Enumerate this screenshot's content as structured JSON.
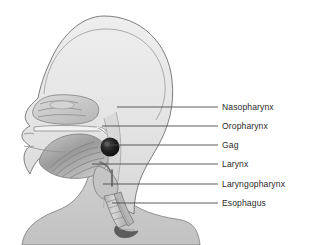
{
  "figure": {
    "background_color": "#ffffff",
    "outline_color": "#6f6f6f",
    "skin_fill_color": "#e6e6e6",
    "neck_fill_color": "#c9c9c9",
    "tissue_fill_color": "#bdbdbd",
    "dark_marker_color": "#1f1f1f",
    "leader_line_color": "#4a4a4a",
    "label_text_color": "#2b2b2b"
  },
  "labels": [
    {
      "id": "nasopharynx",
      "text": "Nasopharynx",
      "text_x": 222,
      "text_y": 102,
      "line_x1": 117,
      "line_x2": 218,
      "line_y": 107
    },
    {
      "id": "oropharynx",
      "text": "Oropharynx",
      "text_x": 222,
      "text_y": 121,
      "line_x1": 102,
      "line_x2": 218,
      "line_y": 126
    },
    {
      "id": "gag",
      "text": "Gag",
      "text_x": 222,
      "text_y": 140,
      "line_x1": 110,
      "line_x2": 218,
      "line_y": 145
    },
    {
      "id": "larynx",
      "text": "Larynx",
      "text_x": 222,
      "text_y": 159,
      "line_x1": 92,
      "line_x2": 218,
      "line_y": 164
    },
    {
      "id": "laryngopharynx",
      "text": "Laryngopharynx",
      "text_x": 222,
      "text_y": 179,
      "line_x1": 103,
      "line_x2": 218,
      "line_y": 184
    },
    {
      "id": "esophagus",
      "text": "Esophagus",
      "text_x": 222,
      "text_y": 198,
      "line_x1": 112,
      "line_x2": 218,
      "line_y": 203
    }
  ],
  "anatomy_parts": [
    {
      "id": "cranium",
      "name": "cranium-dome"
    },
    {
      "id": "nasal-cavity",
      "name": "nasal-cavity-turbinates"
    },
    {
      "id": "hard-palate",
      "name": "hard-palate"
    },
    {
      "id": "tongue",
      "name": "tongue"
    },
    {
      "id": "uvula",
      "name": "uvula-gag-point"
    },
    {
      "id": "epiglottis",
      "name": "epiglottis"
    },
    {
      "id": "larynx-body",
      "name": "larynx"
    },
    {
      "id": "trachea",
      "name": "trachea"
    },
    {
      "id": "esophagus-tube",
      "name": "esophagus"
    },
    {
      "id": "neck",
      "name": "neck-and-shoulder"
    }
  ]
}
